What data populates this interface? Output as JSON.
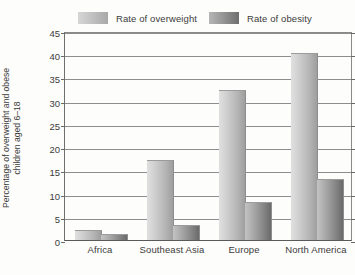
{
  "chart_data": {
    "type": "bar",
    "title": "",
    "subtitle": "",
    "xlabel": "",
    "ylabel": "Percentage of overweight and obese children aged 6–18",
    "ylabel_lines": [
      "Percentage of overweight and obese",
      "children aged 6–18"
    ],
    "categories": [
      "Africa",
      "Southeast Asia",
      "Europe",
      "North America"
    ],
    "series": [
      {
        "name": "Rate of overweight",
        "color": "#c2c2c2",
        "values": [
          2,
          17,
          32,
          40
        ]
      },
      {
        "name": "Rate of obesity",
        "color": "#8a8a8a",
        "values": [
          1,
          3,
          8,
          13
        ]
      }
    ],
    "ylim": [
      0,
      45
    ],
    "ytick_step": 5,
    "ytick_labels": [
      "45",
      "40",
      "35",
      "30",
      "25",
      "20",
      "15",
      "10",
      "5",
      "0"
    ],
    "ytick_values": [
      45,
      40,
      35,
      30,
      25,
      20,
      15,
      10,
      5,
      0
    ],
    "grid": true,
    "grid_axis": "y",
    "legend_position": "top"
  },
  "legend": {
    "entries": [
      {
        "label": "Rate of overweight",
        "swatch": "legend-swatch-overweight"
      },
      {
        "label": "Rate of obesity",
        "swatch": "legend-swatch-obesity"
      }
    ]
  },
  "colors": {
    "background": "#fdfdfb",
    "axis": "#5a5a5a",
    "gridline": "#8d8d8d",
    "text": "#3c3c3c",
    "overweight": "#c2c2c2",
    "obesity": "#8a8a8a"
  }
}
